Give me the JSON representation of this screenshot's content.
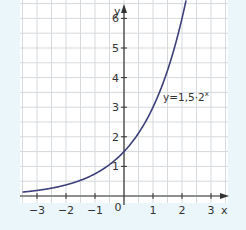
{
  "chart_data": {
    "type": "line",
    "title": "",
    "xlabel": "x",
    "ylabel": "y",
    "xlim": [
      -3.5,
      3.5
    ],
    "ylim": [
      -0.1,
      6.6
    ],
    "x_ticks": [
      -3,
      -2,
      -1,
      0,
      1,
      2,
      3
    ],
    "x_tick_labels": [
      "−3",
      "−2",
      "−1",
      "0",
      "1",
      "2",
      "3"
    ],
    "y_ticks": [
      1,
      2,
      3,
      4,
      5,
      6
    ],
    "y_tick_labels": [
      "1",
      "2",
      "3",
      "4",
      "5",
      "6"
    ],
    "grid": true,
    "grid_step": 0.5,
    "series": [
      {
        "name": "y=1,5·2^x",
        "label_text": "y=1,5·2",
        "label_exponent": "x",
        "function": "1.5*2^x",
        "x": [
          -3.5,
          -3,
          -2,
          -1,
          0,
          1,
          2,
          2.15
        ],
        "values": [
          0.133,
          0.1875,
          0.375,
          0.75,
          1.5,
          3,
          6,
          6.66
        ],
        "color": "#3d3f7a"
      }
    ]
  },
  "colors": {
    "background": "#eaf6fa",
    "plot_bg": "#ffffff",
    "grid": "#d6d9dc",
    "axis": "#333333",
    "curve": "#3d3f7a"
  }
}
